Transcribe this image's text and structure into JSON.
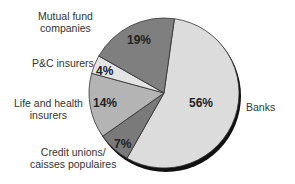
{
  "chart_data": {
    "type": "pie",
    "title": "",
    "categories": [
      "Banks",
      "Credit unions/ caisses populaires",
      "Life and health insurers",
      "P&C insurers",
      "Mutual fund companies"
    ],
    "values": [
      56,
      7,
      14,
      4,
      19
    ],
    "unit": "%",
    "colors": [
      "#dcdcdc",
      "#7a7a7a",
      "#b4b4b4",
      "#e4e4e4",
      "#7f7f7f"
    ],
    "start_angle_deg": 8,
    "direction": "clockwise",
    "legend": "none (direct labels)"
  },
  "labels": {
    "banks": "Banks",
    "credit_unions_line1": "Credit unions/",
    "credit_unions_line2": "caisses populaires",
    "life_health_line1": "Life and health",
    "life_health_line2": "insurers",
    "pc": "P&C insurers",
    "mutual_line1": "Mutual fund",
    "mutual_line2": "companies"
  },
  "percents": {
    "banks": "56%",
    "credit_unions": "7%",
    "life_health": "14%",
    "pc": "4%",
    "mutual": "19%"
  }
}
